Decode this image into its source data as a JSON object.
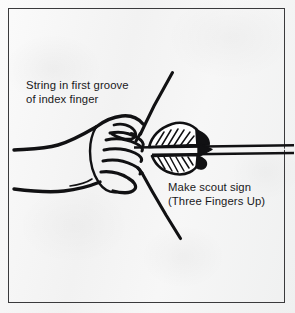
{
  "illustration": {
    "title": "Archery hand grip instructional line drawing",
    "subject": "Hand making scout sign holding bowstring with nocked arrow",
    "background_color": "#f6f6f6",
    "ink_color": "#111113",
    "border_color": "#3a3a3c"
  },
  "border": {
    "name": "panel-border",
    "style": "thin rectangle inset"
  },
  "annotations": [
    {
      "id": "caption-string",
      "lines": [
        "String in first groove",
        "of index finger"
      ]
    },
    {
      "id": "caption-scout",
      "lines": [
        "Make scout sign",
        "(Three Fingers Up)"
      ]
    }
  ],
  "captions": {
    "string_line1": "String in first groove",
    "string_line2": "of index finger",
    "scout_line1": "Make scout sign",
    "scout_line2": "(Three Fingers Up)"
  },
  "drawing_elements": [
    {
      "name": "bowstring-upper",
      "description": "diagonal line rising to upper right from knuckles"
    },
    {
      "name": "bowstring-lower",
      "description": "diagonal line descending to lower right from fingers"
    },
    {
      "name": "arrow-shaft",
      "description": "two parallel horizontal lines running to right edge"
    },
    {
      "name": "arrow-fletching",
      "description": "hatched feather vanes above and below the shaft"
    },
    {
      "name": "hand-fist",
      "description": "closed fist drawn in profile with curled fingers"
    },
    {
      "name": "wrist-upper",
      "description": "upper forearm contour line to left edge"
    },
    {
      "name": "wrist-lower",
      "description": "lower forearm contour line to left edge"
    },
    {
      "name": "thumb",
      "description": "thumb folded over curled fingers"
    }
  ]
}
